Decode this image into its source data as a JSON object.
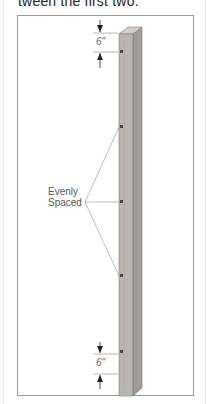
{
  "document": {
    "intro_text": "tween the first two."
  },
  "figure": {
    "top_dimension": "6\"",
    "bottom_dimension": "6\"",
    "callout_line1": "Evenly",
    "callout_line2": "Spaced",
    "screw_count": 5,
    "colors": {
      "frame": "#9a9a9a",
      "board_front": "#b9b5b0",
      "board_side": "#a19c96",
      "board_top": "#d2cfca",
      "dimension_line": "#888888",
      "screw": "#444444"
    }
  }
}
